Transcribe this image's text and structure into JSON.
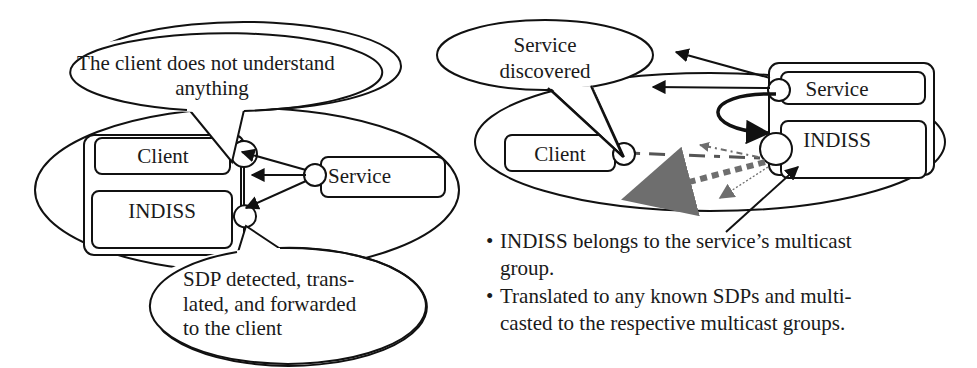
{
  "left_diagram": {
    "callout_top": {
      "line1": "The client does not understand",
      "line2": "anything"
    },
    "client_label": "Client",
    "indiss_label": "INDISS",
    "service_label": "Service",
    "callout_bottom": {
      "line1": "SDP detected, trans-",
      "line2": "lated, and forwarded",
      "line3": "to the client"
    }
  },
  "right_diagram": {
    "callout": {
      "line1": "Service",
      "line2": "discovered"
    },
    "client_label": "Client",
    "service_label": "Service",
    "indiss_label": "INDISS",
    "arrow_colors": {
      "solid": "#111111",
      "gray": "#6e6e6e"
    }
  },
  "bullets": [
    {
      "dot": "•",
      "text_line1": "INDISS belongs to the service’s multicast",
      "text_line2": "group."
    },
    {
      "dot": "•",
      "text_line1": "Translated to any known SDPs and multi-",
      "text_line2": "casted to the respective multicast groups."
    }
  ]
}
